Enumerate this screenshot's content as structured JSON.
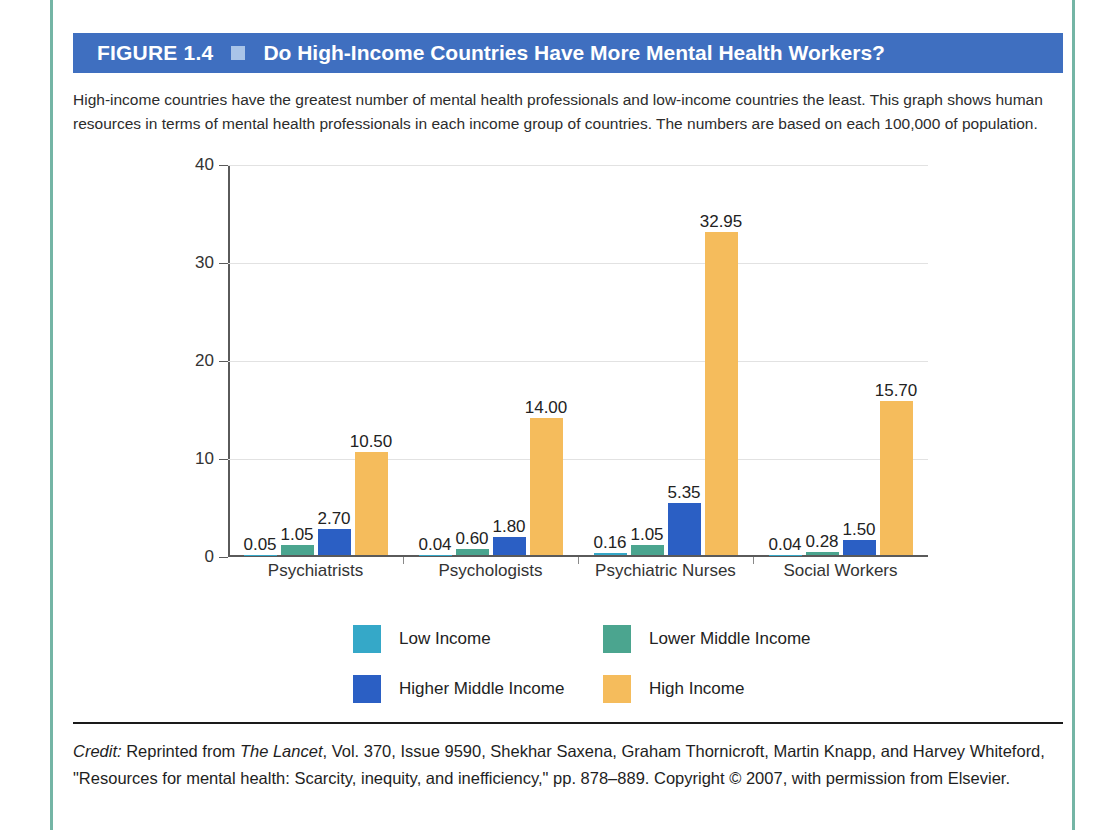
{
  "figure": {
    "number": "FIGURE 1.4",
    "title": "Do High-Income Countries Have More Mental Health Workers?",
    "header_bg": "#3f6fc0",
    "separator_color": "#a9c4e8",
    "caption": "High-income countries have the greatest number of mental health professionals and low-income countries the least. This graph shows human resources in terms of mental health professionals in each income group of countries. The numbers are based on each 100,000 of population."
  },
  "credit": {
    "label": "Credit:",
    "text_before_source": " Reprinted from ",
    "source": "The Lancet",
    "text_after_source": ", Vol. 370, Issue 9590, Shekhar Saxena, Graham Thornicroft, Martin Knapp, and Harvey Whiteford, \"Resources for mental health: Scarcity, inequity, and inefficiency,\" pp. 878–889. Copyright © 2007, with permission from Elsevier."
  },
  "chart_data": {
    "type": "bar",
    "title": "Do High-Income Countries Have More Mental Health Workers?",
    "xlabel": "",
    "ylabel": "",
    "ylim": [
      0,
      40
    ],
    "yticks": [
      0,
      10,
      20,
      30,
      40
    ],
    "grid": true,
    "legend_position": "bottom",
    "categories": [
      "Psychiatrists",
      "Psychologists",
      "Psychiatric Nurses",
      "Social Workers"
    ],
    "series": [
      {
        "name": "Low Income",
        "color": "#35a8c8",
        "values": [
          0.05,
          0.04,
          0.16,
          0.04
        ],
        "labels": [
          "0.05",
          "0.04",
          "0.16",
          "0.04"
        ]
      },
      {
        "name": "Lower Middle Income",
        "color": "#4ba58f",
        "values": [
          1.05,
          0.6,
          1.05,
          0.28
        ],
        "labels": [
          "1.05",
          "0.60",
          "1.05",
          "0.28"
        ]
      },
      {
        "name": "Higher Middle Income",
        "color": "#2b5fc4",
        "values": [
          2.7,
          1.8,
          5.35,
          1.5
        ],
        "labels": [
          "2.70",
          "1.80",
          "5.35",
          "1.50"
        ]
      },
      {
        "name": "High Income",
        "color": "#f5bc5c",
        "values": [
          10.5,
          14.0,
          32.95,
          15.7
        ],
        "labels": [
          "10.50",
          "14.00",
          "32.95",
          "15.70"
        ]
      }
    ]
  }
}
